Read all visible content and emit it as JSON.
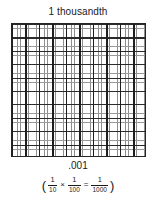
{
  "figure": {
    "title": "1 thousandth",
    "decimal_label": ".001",
    "equation": {
      "open_paren": "(",
      "factor1": {
        "numerator": "1",
        "denominator": "10"
      },
      "times": "×",
      "factor2": {
        "numerator": "1",
        "denominator": "100"
      },
      "equals": "=",
      "result": {
        "numerator": "1",
        "denominator": "1000"
      },
      "close_paren": ")"
    }
  },
  "chart_data": {
    "type": "heatmap",
    "title": "1 thousandth",
    "major_rows": 10,
    "major_cols": 10,
    "total_large_squares": 100,
    "strips_per_square": 10,
    "total_parts": 1000,
    "shaded_parts": 1,
    "fraction_value": 0.001,
    "xlabel": "",
    "ylabel": "",
    "grid": true,
    "legend": "none",
    "colors": {
      "major_line": "#1e1e1e",
      "minor_line": "#9a9a9a",
      "strip_line": "#8e8e8e",
      "background": "#ffffff",
      "text": "#1b1b1b"
    }
  }
}
